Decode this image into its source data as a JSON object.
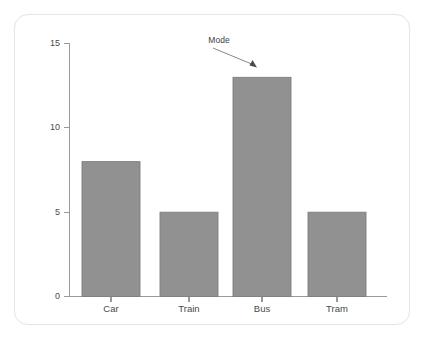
{
  "chart_data": {
    "type": "bar",
    "title": "",
    "subtitle": "",
    "xlabel": "",
    "ylabel": "",
    "categories": [
      "Car",
      "Train",
      "Bus",
      "Tram"
    ],
    "values": [
      8,
      5,
      13,
      5
    ],
    "series": [
      {
        "name": "Count",
        "values": [
          8,
          5,
          13,
          5
        ]
      }
    ],
    "ylim": [
      0,
      15
    ],
    "yticks": [
      0,
      5,
      10,
      15
    ],
    "ytick_labels": [
      "0",
      "5",
      "10",
      "15"
    ],
    "grid": false,
    "legend": false,
    "legend_position": "none",
    "bar_color": "#919191",
    "bar_edge_color": "#7e7e7e",
    "axis_color": "#9a9a9a",
    "annotations": [
      {
        "text": "Mode",
        "target_category": "Bus",
        "target_value": 13,
        "arrow": true
      }
    ]
  },
  "card": {
    "border_color": "#e6e6e6",
    "background": "#ffffff"
  }
}
